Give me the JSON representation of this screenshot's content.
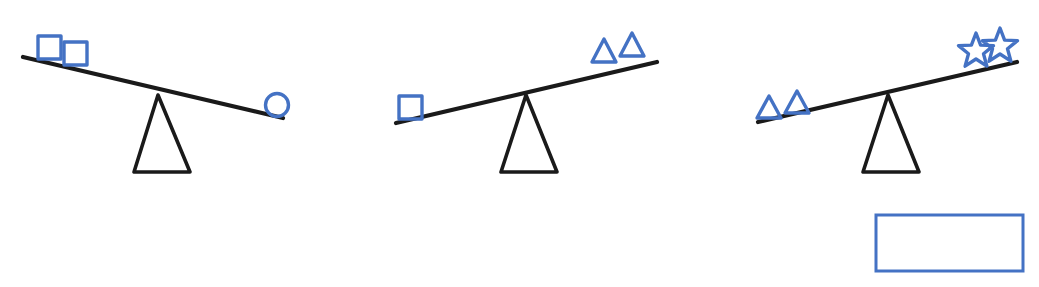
{
  "figure": {
    "background_color": "#ffffff",
    "shape_outline_color": "#4472C4",
    "beam_color": "#1a1a1a",
    "fulcrum_color": "#1a1a1a",
    "answer_box_color": "#4472C4"
  },
  "scales": [
    {
      "id": "scale-1",
      "label": "Balance scale 1",
      "tilt": "left-down",
      "heavier_side": "left",
      "left": {
        "label": "Left pan",
        "items": [
          {
            "shape": "square",
            "icon": "square-icon",
            "count": 1
          },
          {
            "shape": "square",
            "icon": "square-icon",
            "count": 1
          }
        ],
        "shape": "square",
        "count": 2
      },
      "right": {
        "label": "Right pan",
        "items": [
          {
            "shape": "circle",
            "icon": "circle-icon",
            "count": 1
          }
        ],
        "shape": "circle",
        "count": 1
      },
      "relation": "2 squares > 1 circle"
    },
    {
      "id": "scale-2",
      "label": "Balance scale 2",
      "tilt": "left-down",
      "heavier_side": "left",
      "left": {
        "label": "Left pan",
        "items": [
          {
            "shape": "square",
            "icon": "square-icon",
            "count": 1
          }
        ],
        "shape": "square",
        "count": 1
      },
      "right": {
        "label": "Right pan",
        "items": [
          {
            "shape": "triangle",
            "icon": "triangle-icon",
            "count": 1
          },
          {
            "shape": "triangle",
            "icon": "triangle-icon",
            "count": 1
          }
        ],
        "shape": "triangle",
        "count": 2
      },
      "relation": "1 square > 2 triangles"
    },
    {
      "id": "scale-3",
      "label": "Balance scale 3",
      "tilt": "left-down",
      "heavier_side": "left",
      "left": {
        "label": "Left pan",
        "items": [
          {
            "shape": "triangle",
            "icon": "triangle-icon",
            "count": 1
          },
          {
            "shape": "triangle",
            "icon": "triangle-icon",
            "count": 1
          }
        ],
        "shape": "triangle",
        "count": 2
      },
      "right": {
        "label": "Right pan",
        "items": [
          {
            "shape": "star",
            "icon": "star-icon",
            "count": 1
          },
          {
            "shape": "star",
            "icon": "star-icon",
            "count": 1
          }
        ],
        "shape": "star",
        "count": 2
      },
      "relation": "2 triangles > 2 stars"
    }
  ],
  "answer_box": {
    "label": "Answer box",
    "value": "",
    "placeholder": "",
    "x": 876,
    "y": 215,
    "width": 147,
    "height": 56
  }
}
